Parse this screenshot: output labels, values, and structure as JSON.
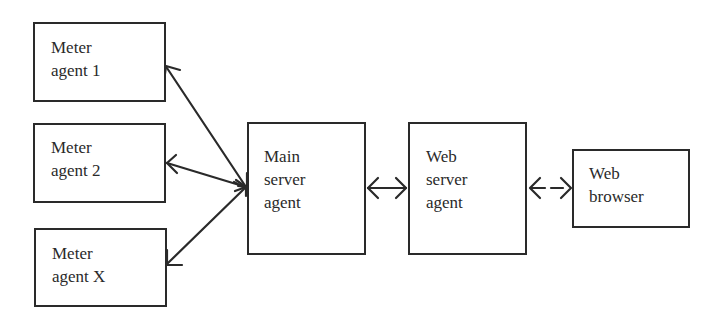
{
  "diagram": {
    "nodes": [
      {
        "id": "meter1",
        "label": "Meter\nagent 1"
      },
      {
        "id": "meter2",
        "label": "Meter\nagent 2"
      },
      {
        "id": "meterX",
        "label": "Meter\nagent X"
      },
      {
        "id": "main",
        "label": "Main\nserver\nagent"
      },
      {
        "id": "webserver",
        "label": "Web\nserver\nagent"
      },
      {
        "id": "browser",
        "label": "Web\nbrowser"
      }
    ],
    "edges": [
      {
        "from": "main",
        "to": "meter1",
        "style": "solid",
        "direction": "bidirectional"
      },
      {
        "from": "main",
        "to": "meter2",
        "style": "solid",
        "direction": "bidirectional"
      },
      {
        "from": "main",
        "to": "meterX",
        "style": "solid",
        "direction": "bidirectional"
      },
      {
        "from": "main",
        "to": "webserver",
        "style": "solid",
        "direction": "bidirectional"
      },
      {
        "from": "webserver",
        "to": "browser",
        "style": "dashed",
        "direction": "bidirectional"
      }
    ],
    "colors": {
      "stroke": "#2a2a2a",
      "background": "#ffffff"
    }
  }
}
